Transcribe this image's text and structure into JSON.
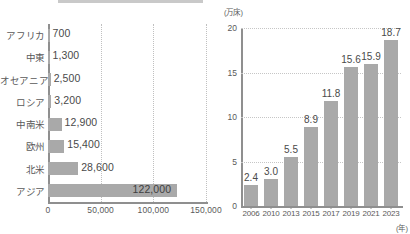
{
  "figure": {
    "background_color": "#ffffff",
    "bar_color": "#a9a9a9",
    "axis_color": "#8f8f8f",
    "grid_color": "#c6c6c6",
    "text_color": "#4d4d4d"
  },
  "chart_data": [
    {
      "id": "regional-bar-chart",
      "type": "bar",
      "orientation": "horizontal",
      "title": "",
      "xlabel": "",
      "ylabel": "",
      "categories": [
        "アフリカ",
        "中東",
        "オセアニア",
        "ロシア",
        "中南米",
        "欧州",
        "北米",
        "アジア"
      ],
      "values": [
        700,
        1300,
        2500,
        3200,
        12900,
        15400,
        28600,
        122000
      ],
      "value_labels": [
        "700",
        "1,300",
        "2,500",
        "3,200",
        "12,900",
        "15,400",
        "28,600",
        "122,000"
      ],
      "xlim": [
        0,
        150000
      ],
      "xticks": [
        0,
        50000,
        100000,
        150000
      ],
      "xtick_labels": [
        "0",
        "50,000",
        "100,000",
        "150,000"
      ],
      "grid": true,
      "legend": "none"
    },
    {
      "id": "yearly-bar-chart",
      "type": "bar",
      "orientation": "vertical",
      "title": "",
      "xlabel": "(年)",
      "ylabel": "(万床)",
      "categories": [
        "2006",
        "2010",
        "2013",
        "2015",
        "2017",
        "2019",
        "2021",
        "2023"
      ],
      "values": [
        2.4,
        3.0,
        5.5,
        8.9,
        11.8,
        15.6,
        15.9,
        18.7
      ],
      "value_labels": [
        "2.4",
        "3.0",
        "5.5",
        "8.9",
        "11.8",
        "15.6",
        "15.9",
        "18.7"
      ],
      "ylim": [
        0,
        20
      ],
      "yticks": [
        0,
        5,
        10,
        15,
        20
      ],
      "ytick_labels": [
        "0",
        "5",
        "10",
        "15",
        "20"
      ],
      "grid": true,
      "legend": "none"
    }
  ]
}
